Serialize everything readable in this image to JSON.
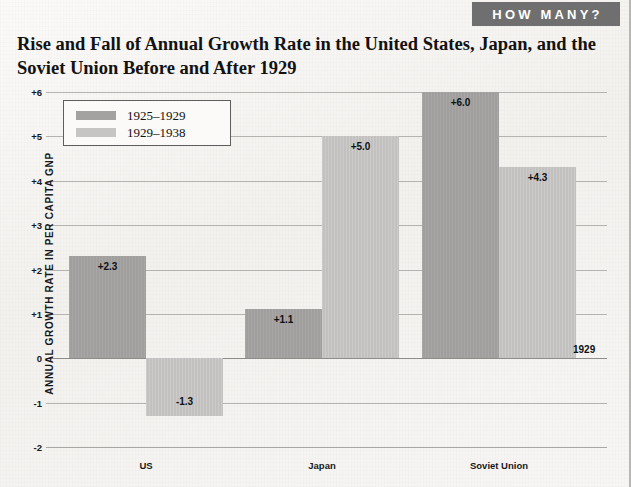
{
  "banner": {
    "label": "HOW MANY?"
  },
  "title": "Rise and Fall of Annual Growth Rate in the United States, Japan, and the Soviet Union Before and After 1929",
  "legend": {
    "entries": [
      {
        "label": "1925–1929",
        "swatch": "dark",
        "color": "#a3a2a0"
      },
      {
        "label": "1929–1938",
        "swatch": "light",
        "color": "#c6c5c3"
      }
    ]
  },
  "annotations": {
    "zero_line": "1929"
  },
  "chart_data": {
    "type": "bar",
    "title": "Rise and Fall of Annual Growth Rate in the United States, Japan, and the Soviet Union Before and After 1929",
    "xlabel": "",
    "ylabel": "ANNUAL GROWTH RATE IN PER CAPITA GNP",
    "categories": [
      "US",
      "Japan",
      "Soviet Union"
    ],
    "series": [
      {
        "name": "1925–1929",
        "color": "#a3a2a0",
        "values": [
          2.3,
          1.1,
          6.0
        ],
        "labels": [
          "+2.3",
          "+1.1",
          "+6.0"
        ]
      },
      {
        "name": "1929–1938",
        "color": "#c6c5c3",
        "values": [
          -1.3,
          5.0,
          4.3
        ],
        "labels": [
          "-1.3",
          "+5.0",
          "+4.3"
        ]
      }
    ],
    "ylim": [
      -2,
      6
    ],
    "yticks": [
      6,
      5,
      4,
      3,
      2,
      1,
      0,
      -1,
      -2
    ],
    "ytick_labels": [
      "+6",
      "+5",
      "+4",
      "+3",
      "+2",
      "+1",
      "0",
      "-1",
      "-2"
    ],
    "grid": true,
    "legend_position": "upper-left"
  }
}
